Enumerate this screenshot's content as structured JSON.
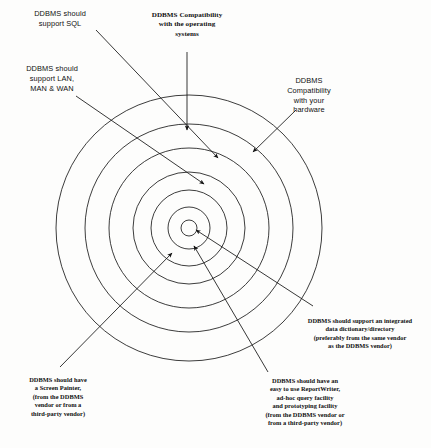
{
  "diagram": {
    "center": {
      "x": 189,
      "y": 228
    },
    "ring_count": 6,
    "ring_radii": [
      8,
      21,
      38,
      56,
      80,
      104,
      133
    ],
    "stroke_color": "#1a1a1a",
    "background_color": "#fdfdfc",
    "labels": [
      {
        "id": "sql",
        "text": "DDBMS should\nsupport SQL",
        "position": "top-left",
        "arrow_from": {
          "x": 96,
          "y": 30
        },
        "arrow_to": {
          "x": 218,
          "y": 158
        }
      },
      {
        "id": "network",
        "text": "DDBMS should\nsupport LAN,\nMAN & WAN",
        "position": "left",
        "arrow_from": {
          "x": 76,
          "y": 96
        },
        "arrow_to": {
          "x": 204,
          "y": 184
        }
      },
      {
        "id": "operating-systems",
        "text": "DDBMS Compatibility\nwith the operating\nsystems",
        "position": "top-center",
        "arrow_from": {
          "x": 187,
          "y": 52
        },
        "arrow_to": {
          "x": 187,
          "y": 130
        }
      },
      {
        "id": "hardware",
        "text": "DDBMS\nCompatibility\nwith your\nhardware",
        "position": "top-right",
        "arrow_from": {
          "x": 296,
          "y": 110
        },
        "arrow_to": {
          "x": 253,
          "y": 152
        }
      },
      {
        "id": "data-dictionary",
        "text": "DDBMS should support an integrated\ndata dictionary/directory\n(preferably from the same vendor\nas the DDBMS vendor)",
        "position": "bottom-right",
        "arrow_from": {
          "x": 313,
          "y": 306
        },
        "arrow_to": {
          "x": 196,
          "y": 230
        }
      },
      {
        "id": "report-writer",
        "text": "DDBMS should have an\neasy to use ReportWriter,\nad-hoc query facility\nand prototyping facility\n(from the DDBMS vendor or\nfrom a third-party vendor)",
        "position": "bottom-center",
        "arrow_from": {
          "x": 268,
          "y": 372
        },
        "arrow_to": {
          "x": 194,
          "y": 246
        }
      },
      {
        "id": "screen-painter",
        "text": "DDBMS should have\na Screen Painter,\n(from the DDBMS\nvendor or from a\nthird-party vendor)",
        "position": "bottom-left",
        "arrow_from": {
          "x": 60,
          "y": 367
        },
        "arrow_to": {
          "x": 172,
          "y": 253
        }
      }
    ]
  }
}
